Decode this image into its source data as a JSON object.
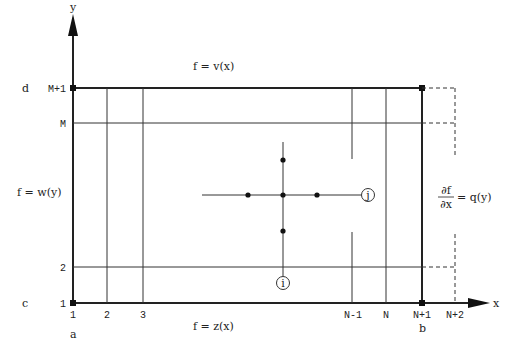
{
  "diagram": {
    "axes": {
      "x_label": "x",
      "y_label": "y"
    },
    "corner_labels": {
      "a": "a",
      "b": "b",
      "c": "c",
      "d": "d"
    },
    "x_ticks": [
      "1",
      "2",
      "3",
      "N-1",
      "N",
      "N+1",
      "N+2"
    ],
    "y_ticks": [
      "1",
      "2",
      "M",
      "M+1"
    ],
    "boundary_conditions": {
      "top": "f = v(x)",
      "bottom": "f = z(x)",
      "left": "f = w(y)",
      "right_numerator": "∂f",
      "right_denominator": "∂x",
      "right_rhs": "= q(y)"
    },
    "nodes": {
      "i": "i",
      "j": "j"
    },
    "colors": {
      "line": "#222222",
      "background": "#ffffff"
    }
  }
}
